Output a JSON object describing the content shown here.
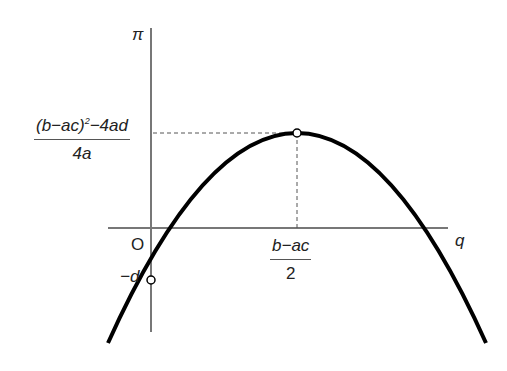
{
  "diagram": {
    "type": "parabola-profit-curve",
    "axes": {
      "y_label": "π",
      "x_label": "q",
      "origin_label": "O"
    },
    "annotations": {
      "vertex_y_label": {
        "numerator": "(b−ac)",
        "numerator_exp": "2",
        "numerator_tail": "−4ad",
        "denominator": "4a"
      },
      "vertex_x_label": {
        "numerator": "b−ac",
        "denominator": "2"
      },
      "intercept_label": "−d"
    },
    "colors": {
      "curve": "#000000",
      "axes": "#777777",
      "dashed": "#555555"
    }
  }
}
